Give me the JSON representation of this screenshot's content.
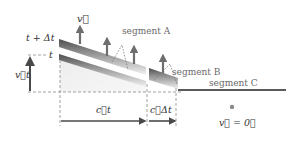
{
  "labels": {
    "velocity_top": "v⃗",
    "t_plus_dt": "t + Δt",
    "t": "t",
    "vt": "v⃗t",
    "ct": "c⃗t",
    "c_dt": "c⃗Δt",
    "segment_a": "segment A",
    "segment_b": "segment B",
    "segment_c": "segment C",
    "v_zero": "v⃗ = 0⃗"
  },
  "colors": {
    "band_dark": "#555555",
    "band_mid": "#9a9a9a",
    "band_light": "#e6e6e6",
    "fill_light": "#f0f0f0",
    "arrow": "#6e6e6e",
    "axis_arrow": "#4a4a4a",
    "dashed": "#8a8a8a",
    "segment_c_line": "#5a5a5a",
    "dot": "#8a8a8a"
  }
}
